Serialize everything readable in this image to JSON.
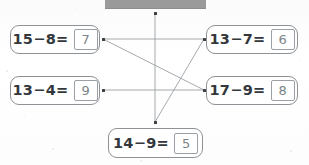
{
  "worksheet": {
    "title": "Subtraction matching exercise",
    "header_bar_color": "#9a9a9a",
    "line_color": "#9ba0a4",
    "dot_color": "#3b3f43"
  },
  "equations": [
    {
      "id": "box-0",
      "minuend": "15",
      "operator": "−",
      "subtrahend": "8",
      "equals": "=",
      "expression": "15−8=",
      "answer": "7",
      "position": "left-top"
    },
    {
      "id": "box-1",
      "minuend": "13",
      "operator": "−",
      "subtrahend": "4",
      "equals": "=",
      "expression": "13−4=",
      "answer": "9",
      "position": "left-middle"
    },
    {
      "id": "box-2",
      "minuend": "13",
      "operator": "−",
      "subtrahend": "7",
      "equals": "=",
      "expression": "13−7=",
      "answer": "6",
      "position": "right-top"
    },
    {
      "id": "box-3",
      "minuend": "17",
      "operator": "−",
      "subtrahend": "9",
      "equals": "=",
      "expression": "17−9=",
      "answer": "8",
      "position": "right-middle"
    },
    {
      "id": "box-4",
      "minuend": "14",
      "operator": "−",
      "subtrahend": "9",
      "equals": "=",
      "expression": "14−9=",
      "answer": "5",
      "position": "bottom-center"
    }
  ],
  "connection_nodes": [
    {
      "name": "node-top",
      "x": 155,
      "y": 13
    },
    {
      "name": "node-left-top",
      "x": 103,
      "y": 39
    },
    {
      "name": "node-left-middle",
      "x": 103,
      "y": 90
    },
    {
      "name": "node-right-top",
      "x": 204,
      "y": 39
    },
    {
      "name": "node-right-middle",
      "x": 204,
      "y": 90
    },
    {
      "name": "node-bottom",
      "x": 155,
      "y": 122
    }
  ],
  "connections": [
    {
      "name": "line-lefttop-to-righttop",
      "from": "node-left-top",
      "to": "node-right-top",
      "x1": 103,
      "y1": 39,
      "x2": 204,
      "y2": 39
    },
    {
      "name": "line-lefttop-to-rightmiddle",
      "from": "node-left-top",
      "to": "node-right-middle",
      "x1": 103,
      "y1": 39,
      "x2": 204,
      "y2": 90
    },
    {
      "name": "line-leftmiddle-to-rightmiddle",
      "from": "node-left-middle",
      "to": "node-right-middle",
      "x1": 103,
      "y1": 90,
      "x2": 204,
      "y2": 90
    },
    {
      "name": "line-top-to-bottom",
      "from": "node-top",
      "to": "node-bottom",
      "x1": 155,
      "y1": 13,
      "x2": 155,
      "y2": 122
    },
    {
      "name": "line-bottom-to-righttop",
      "from": "node-bottom",
      "to": "node-right-top",
      "x1": 155,
      "y1": 122,
      "x2": 204,
      "y2": 39
    }
  ]
}
